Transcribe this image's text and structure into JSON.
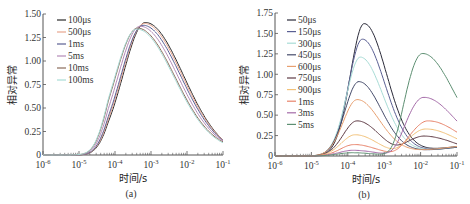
{
  "chart_data": [
    {
      "id": "a",
      "type": "line",
      "caption": "(a)",
      "xlabel": "时间/s",
      "ylabel": "相对异常",
      "xscale": "log",
      "xlim": [
        1e-06,
        0.1
      ],
      "ylim": [
        0,
        1.5
      ],
      "xticks": [
        "10^-6",
        "10^-5",
        "10^-4",
        "10^-3",
        "10^-2",
        "10^-1"
      ],
      "yticks": [
        "0",
        "0.25",
        "0.50",
        "0.75",
        "1.00",
        "1.25",
        "1.50"
      ],
      "legend_position": "upper left",
      "grid": false,
      "series": [
        {
          "name": "100μs",
          "color": "#2b2b2b",
          "peak_x": 0.0007,
          "peak_y": 1.41,
          "end_y": 0.16
        },
        {
          "name": "500μs",
          "color": "#e8a58e",
          "peak_x": 0.00065,
          "peak_y": 1.4,
          "end_y": 0.16
        },
        {
          "name": "1ms",
          "color": "#5a5f93",
          "peak_x": 0.0006,
          "peak_y": 1.38,
          "end_y": 0.155
        },
        {
          "name": "5ms",
          "color": "#b48ab8",
          "peak_x": 0.0005,
          "peak_y": 1.37,
          "end_y": 0.15
        },
        {
          "name": "10ms",
          "color": "#8a6a5a",
          "peak_x": 0.00042,
          "peak_y": 1.35,
          "end_y": 0.14
        },
        {
          "name": "100ms",
          "color": "#a8dcd6",
          "peak_x": 0.0004,
          "peak_y": 1.34,
          "end_y": 0.13
        }
      ]
    },
    {
      "id": "b",
      "type": "line",
      "caption": "(b)",
      "xlabel": "时间/s",
      "ylabel": "相对异常",
      "xscale": "log",
      "xlim": [
        1e-06,
        0.1
      ],
      "ylim": [
        0,
        1.75
      ],
      "xticks": [
        "10^-6",
        "10^-5",
        "10^-4",
        "10^-3",
        "10^-2",
        "10^-1"
      ],
      "yticks": [
        "0",
        "0.25",
        "0.50",
        "0.75",
        "1.00",
        "1.25",
        "1.50",
        "1.75"
      ],
      "legend_position": "upper left",
      "grid": false,
      "series": [
        {
          "name": "50μs",
          "color": "#2b2b3a",
          "peak1_x": 0.00028,
          "peak1_y": 1.62,
          "end_y": 0.13
        },
        {
          "name": "150μs",
          "color": "#5a5f93",
          "peak1_x": 0.00025,
          "peak1_y": 1.43,
          "end_y": 0.12
        },
        {
          "name": "300μs",
          "color": "#a8dcd6",
          "peak1_x": 0.00022,
          "peak1_y": 1.21,
          "end_y": 0.12
        },
        {
          "name": "450μs",
          "color": "#454b6a",
          "peak1_x": 0.0002,
          "peak1_y": 0.91,
          "end_y": 0.12
        },
        {
          "name": "600μs",
          "color": "#e8a070",
          "peak1_x": 0.00018,
          "peak1_y": 0.69,
          "end_y": 0.13
        },
        {
          "name": "750μs",
          "color": "#5e3a44",
          "peak1_x": 0.00018,
          "peak1_y": 0.43,
          "peak2_x": 0.013,
          "peak2_y": 0.24,
          "end_y": 0.14
        },
        {
          "name": "900μs",
          "color": "#f2c27a",
          "peak1_x": 0.00016,
          "peak1_y": 0.26,
          "peak2_x": 0.014,
          "peak2_y": 0.33,
          "end_y": 0.2
        },
        {
          "name": "1ms",
          "color": "#e8836a",
          "peak1_x": 0.00015,
          "peak1_y": 0.14,
          "peak2_x": 0.016,
          "peak2_y": 0.43,
          "end_y": 0.25
        },
        {
          "name": "3ms",
          "color": "#a46aa8",
          "peak1_x": 0.00014,
          "peak1_y": 0.07,
          "peak2_x": 0.012,
          "peak2_y": 0.72,
          "end_y": 0.37
        },
        {
          "name": "5ms",
          "color": "#5d8f72",
          "peak1_x": 0.00013,
          "peak1_y": 0.04,
          "peak2_x": 0.011,
          "peak2_y": 1.26,
          "end_y": 0.61
        }
      ]
    }
  ]
}
